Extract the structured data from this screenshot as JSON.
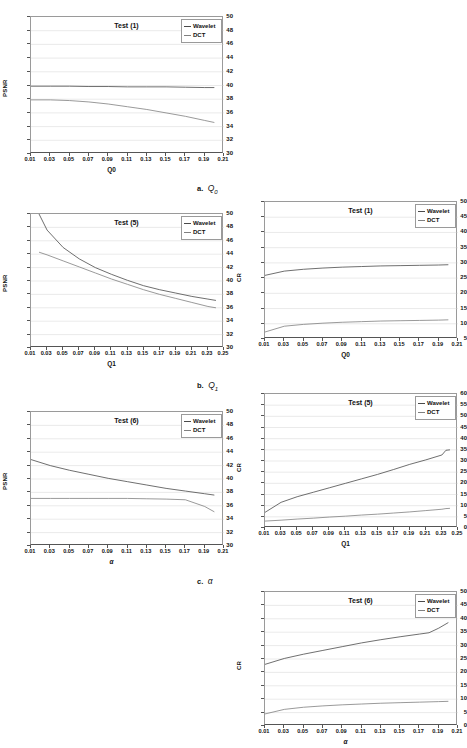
{
  "figure": {
    "legend_labels": [
      "Wavelet",
      "DCT"
    ],
    "series_colors": {
      "wavelet": "#4a4a4a",
      "dct": "#808080"
    },
    "captions": [
      {
        "label": "a.",
        "symbol": "Q",
        "sub": "0"
      },
      {
        "label": "b.",
        "symbol": "Q",
        "sub": "1"
      },
      {
        "label": "c.",
        "symbol": "α",
        "sub": ""
      }
    ]
  },
  "chart_data": [
    {
      "id": "a-left",
      "type": "line",
      "title": "Test (1)",
      "xlabel": "Q0",
      "ylabel": "PSNR",
      "xlim": [
        0.01,
        0.21
      ],
      "ylim": [
        30,
        50
      ],
      "xticks": [
        "0.01",
        "0.03",
        "0.05",
        "0.07",
        "0.09",
        "0.11",
        "0.13",
        "0.15",
        "0.17",
        "0.19",
        "0.21"
      ],
      "yticks": [
        "30",
        "32",
        "34",
        "36",
        "38",
        "40",
        "42",
        "44",
        "46",
        "48",
        "50"
      ],
      "grid": true,
      "legend": "top-right",
      "x": [
        0.01,
        0.03,
        0.05,
        0.07,
        0.09,
        0.11,
        0.13,
        0.15,
        0.17,
        0.19,
        0.2
      ],
      "series": [
        {
          "name": "Wavelet",
          "values": [
            39.9,
            39.9,
            39.9,
            39.85,
            39.85,
            39.8,
            39.8,
            39.8,
            39.75,
            39.7,
            39.7
          ]
        },
        {
          "name": "DCT",
          "values": [
            37.9,
            37.9,
            37.8,
            37.6,
            37.3,
            36.9,
            36.5,
            36.0,
            35.5,
            34.9,
            34.6
          ]
        }
      ]
    },
    {
      "id": "a-right",
      "type": "line",
      "title": "Test (1)",
      "xlabel": "Q0",
      "ylabel": "CR",
      "xlim": [
        0.01,
        0.21
      ],
      "ylim": [
        5,
        50
      ],
      "xticks": [
        "0.01",
        "0.03",
        "0.05",
        "0.07",
        "0.09",
        "0.11",
        "0.13",
        "0.15",
        "0.17",
        "0.19",
        "0.21"
      ],
      "yticks": [
        "5",
        "10",
        "15",
        "20",
        "25",
        "30",
        "35",
        "40",
        "45",
        "50"
      ],
      "grid": true,
      "legend": "top-right",
      "x": [
        0.01,
        0.03,
        0.05,
        0.07,
        0.09,
        0.11,
        0.13,
        0.15,
        0.17,
        0.19,
        0.2
      ],
      "series": [
        {
          "name": "Wavelet",
          "values": [
            25.9,
            27.3,
            27.9,
            28.3,
            28.6,
            28.8,
            29.0,
            29.1,
            29.2,
            29.3,
            29.4
          ]
        },
        {
          "name": "DCT",
          "values": [
            7.3,
            9.2,
            9.8,
            10.2,
            10.5,
            10.7,
            10.9,
            11.0,
            11.1,
            11.2,
            11.3
          ]
        }
      ]
    },
    {
      "id": "b-left",
      "type": "line",
      "title": "Test (5)",
      "xlabel": "Q1",
      "ylabel": "PSNR",
      "xlim": [
        0.01,
        0.25
      ],
      "ylim": [
        30,
        50
      ],
      "xticks": [
        "0.01",
        "0.03",
        "0.05",
        "0.07",
        "0.09",
        "0.11",
        "0.13",
        "0.15",
        "0.17",
        "0.19",
        "0.21",
        "0.23",
        "0.25"
      ],
      "yticks": [
        "30",
        "32",
        "34",
        "36",
        "38",
        "40",
        "42",
        "44",
        "46",
        "48",
        "50"
      ],
      "grid": true,
      "legend": "top-right",
      "x": [
        0.02,
        0.03,
        0.05,
        0.07,
        0.09,
        0.11,
        0.13,
        0.15,
        0.17,
        0.19,
        0.21,
        0.23,
        0.24
      ],
      "series": [
        {
          "name": "Wavelet",
          "values": [
            50.0,
            47.6,
            45.0,
            43.3,
            42.0,
            41.0,
            40.1,
            39.3,
            38.7,
            38.2,
            37.7,
            37.3,
            37.1
          ]
        },
        {
          "name": "DCT",
          "values": [
            44.3,
            43.9,
            43.0,
            42.1,
            41.2,
            40.3,
            39.5,
            38.7,
            38.0,
            37.4,
            36.8,
            36.2,
            36.0
          ]
        }
      ]
    },
    {
      "id": "b-right",
      "type": "line",
      "title": "Test (5)",
      "xlabel": "Q1",
      "ylabel": "CR",
      "xlim": [
        0.01,
        0.25
      ],
      "ylim": [
        0,
        60
      ],
      "xticks": [
        "0.01",
        "0.03",
        "0.05",
        "0.07",
        "0.09",
        "0.11",
        "0.13",
        "0.15",
        "0.17",
        "0.19",
        "0.21",
        "0.23",
        "0.25"
      ],
      "yticks": [
        "0",
        "5",
        "10",
        "15",
        "20",
        "25",
        "30",
        "35",
        "40",
        "45",
        "50",
        "55",
        "60"
      ],
      "grid": true,
      "legend": "top-right",
      "x": [
        0.01,
        0.03,
        0.05,
        0.07,
        0.09,
        0.11,
        0.13,
        0.15,
        0.17,
        0.19,
        0.21,
        0.23,
        0.235,
        0.24
      ],
      "series": [
        {
          "name": "Wavelet",
          "values": [
            7.0,
            11.5,
            14.0,
            16.0,
            18.0,
            20.0,
            22.0,
            24.0,
            26.2,
            28.5,
            30.5,
            32.7,
            34.8,
            35.0
          ]
        },
        {
          "name": "DCT",
          "values": [
            3.1,
            3.5,
            4.0,
            4.4,
            4.9,
            5.3,
            5.8,
            6.2,
            6.7,
            7.2,
            7.8,
            8.4,
            8.7,
            8.8
          ]
        }
      ]
    },
    {
      "id": "c-left",
      "type": "line",
      "title": "Test (6)",
      "xlabel": "α",
      "ylabel": "PSNR",
      "xlim": [
        0.01,
        0.21
      ],
      "ylim": [
        30,
        50
      ],
      "xticks": [
        "0.01",
        "0.03",
        "0.05",
        "0.07",
        "0.09",
        "0.11",
        "0.13",
        "0.15",
        "0.17",
        "0.19",
        "0.21"
      ],
      "yticks": [
        "30",
        "32",
        "34",
        "36",
        "38",
        "40",
        "42",
        "44",
        "46",
        "48",
        "50"
      ],
      "grid": true,
      "legend": "top-right",
      "x": [
        0.01,
        0.03,
        0.05,
        0.07,
        0.09,
        0.11,
        0.13,
        0.15,
        0.17,
        0.19,
        0.2
      ],
      "series": [
        {
          "name": "Wavelet",
          "values": [
            42.9,
            42.0,
            41.3,
            40.7,
            40.1,
            39.6,
            39.1,
            38.6,
            38.2,
            37.8,
            37.6
          ]
        },
        {
          "name": "DCT",
          "values": [
            37.1,
            37.1,
            37.1,
            37.1,
            37.1,
            37.1,
            37.05,
            37.0,
            36.9,
            35.9,
            35.1
          ]
        }
      ]
    },
    {
      "id": "c-right",
      "type": "line",
      "title": "Test (6)",
      "xlabel": "α",
      "ylabel": "CR",
      "xlim": [
        0.01,
        0.21
      ],
      "ylim": [
        0,
        50
      ],
      "xticks": [
        "0.01",
        "0.03",
        "0.05",
        "0.07",
        "0.09",
        "0.11",
        "0.13",
        "0.15",
        "0.17",
        "0.19",
        "0.21"
      ],
      "yticks": [
        "0",
        "5",
        "10",
        "15",
        "20",
        "25",
        "30",
        "35",
        "40",
        "45",
        "50"
      ],
      "grid": true,
      "legend": "top-right",
      "x": [
        0.01,
        0.03,
        0.05,
        0.07,
        0.09,
        0.11,
        0.13,
        0.15,
        0.17,
        0.18,
        0.19,
        0.2
      ],
      "series": [
        {
          "name": "Wavelet",
          "values": [
            23.0,
            25.2,
            26.8,
            28.2,
            29.6,
            31.0,
            32.2,
            33.3,
            34.3,
            34.8,
            36.5,
            38.6
          ]
        },
        {
          "name": "DCT",
          "values": [
            4.5,
            6.2,
            7.0,
            7.5,
            7.9,
            8.2,
            8.5,
            8.7,
            8.9,
            9.0,
            9.1,
            9.2
          ]
        }
      ]
    }
  ]
}
